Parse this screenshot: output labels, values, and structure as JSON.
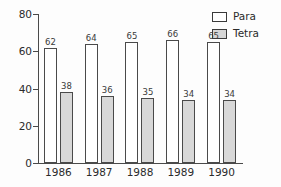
{
  "chart_data": {
    "type": "bar",
    "title": "",
    "subtitle": "",
    "xlabel": "",
    "ylabel": "",
    "categories": [
      "1986",
      "1987",
      "1988",
      "1989",
      "1990"
    ],
    "series": [
      {
        "name": "Para",
        "values": [
          62,
          64,
          65,
          66,
          65
        ],
        "color": "#ffffff"
      },
      {
        "name": "Tetra",
        "values": [
          38,
          36,
          35,
          34,
          34
        ],
        "color": "#d8d8d8"
      }
    ],
    "ylim": [
      0,
      80
    ],
    "yticks": [
      0,
      20,
      40,
      60,
      80
    ],
    "ytick_labels": [
      "0",
      "20",
      "40",
      "60",
      "80"
    ],
    "grid": false,
    "legend_position": "top-right",
    "data_labels": true,
    "axis_color": "#4a4a4a",
    "bar_border_color": "#4a4a4a",
    "background_color": "#fdfdfd"
  },
  "legend": {
    "items": [
      {
        "label": "Para",
        "swatch": "legend-swatch-para"
      },
      {
        "label": "Tetra",
        "swatch": "legend-swatch-tetra"
      }
    ]
  }
}
